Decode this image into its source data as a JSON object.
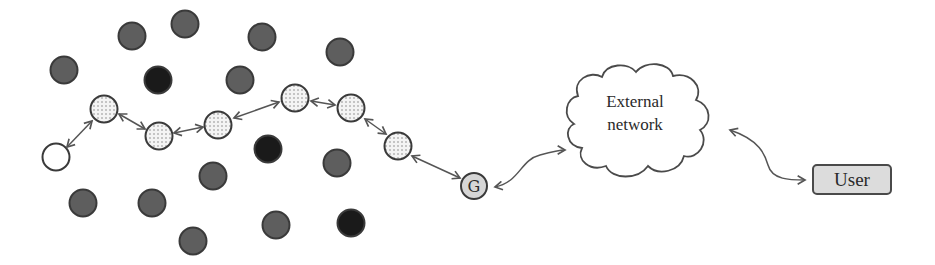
{
  "diagram": {
    "colors": {
      "gray_node": "#5e5e5e",
      "black_node": "#1a1a1a",
      "node_stroke": "#3a3a3a",
      "dotted_fill": "#f2f2f2",
      "dot_color": "#8a8a8a",
      "gateway_fill": "#d6d6d6",
      "user_fill": "#dcdcdc",
      "arrow": "#555555"
    },
    "nodes": {
      "gray": [
        {
          "x": 64,
          "y": 70
        },
        {
          "x": 132,
          "y": 36
        },
        {
          "x": 185,
          "y": 24
        },
        {
          "x": 262,
          "y": 37
        },
        {
          "x": 340,
          "y": 52
        },
        {
          "x": 240,
          "y": 80
        },
        {
          "x": 83,
          "y": 203
        },
        {
          "x": 152,
          "y": 203
        },
        {
          "x": 213,
          "y": 176
        },
        {
          "x": 193,
          "y": 241
        },
        {
          "x": 276,
          "y": 225
        },
        {
          "x": 337,
          "y": 163
        }
      ],
      "black": [
        {
          "x": 158,
          "y": 80
        },
        {
          "x": 268,
          "y": 149
        },
        {
          "x": 351,
          "y": 223
        }
      ],
      "white": [
        {
          "x": 56,
          "y": 157
        }
      ],
      "dotted_path": [
        {
          "x": 104,
          "y": 109
        },
        {
          "x": 159,
          "y": 136
        },
        {
          "x": 218,
          "y": 125
        },
        {
          "x": 295,
          "y": 98
        },
        {
          "x": 351,
          "y": 108
        },
        {
          "x": 398,
          "y": 146
        }
      ]
    },
    "gateway": {
      "label": "G",
      "x": 474,
      "y": 186
    },
    "cloud": {
      "line1": "External",
      "line2": "network"
    },
    "user": {
      "label": "User"
    }
  }
}
